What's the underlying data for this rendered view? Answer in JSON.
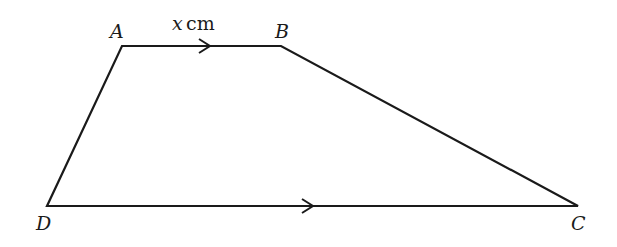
{
  "diagram": {
    "type": "trapezium",
    "stroke_color": "#1a1a1a",
    "vertices": {
      "A": {
        "label": "A",
        "x": 122,
        "y": 46
      },
      "B": {
        "label": "B",
        "x": 281,
        "y": 46
      },
      "C": {
        "label": "C",
        "x": 578,
        "y": 206
      },
      "D": {
        "label": "D",
        "x": 47,
        "y": 206
      }
    },
    "edges": [
      {
        "from": "A",
        "to": "B",
        "parallel_arrow": true
      },
      {
        "from": "B",
        "to": "C",
        "parallel_arrow": false
      },
      {
        "from": "C",
        "to": "D",
        "parallel_arrow": true
      },
      {
        "from": "D",
        "to": "A",
        "parallel_arrow": false
      }
    ],
    "side_label": {
      "edge": "AB",
      "variable": "x",
      "unit": "cm"
    }
  }
}
